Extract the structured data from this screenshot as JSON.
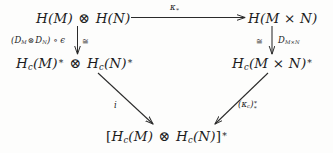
{
  "diagram": {
    "nodes": {
      "top_left": "H(M) ⊗ H(N)",
      "top_right": "H(M × N)",
      "middle_left": "H_c(M)* ⊗ H_c(N)*",
      "middle_right": "H_c(M × N)*",
      "bottom": "[H_c(M) ⊗ H_c(N)]*"
    },
    "arrows": {
      "top_horizontal": {
        "label": "κ∗",
        "from": "top_left",
        "to": "top_right"
      },
      "left_vertical": {
        "label": "(D_M ⊗ D_N) ∘ ϵ",
        "iso_label": "≅",
        "from": "top_left",
        "to": "middle_left"
      },
      "right_vertical": {
        "label": "D_{M×N}",
        "iso_label": "≅",
        "from": "top_right",
        "to": "middle_right"
      },
      "left_diagonal": {
        "label": "i",
        "from": "middle_left",
        "to": "bottom"
      },
      "right_diagonal": {
        "label": "(κ_c)*∗",
        "from": "middle_right",
        "to": "bottom"
      }
    },
    "colors": {
      "ink": "#1c1c1c",
      "stroke": "#2a2a2a",
      "background": "#fdfdfc"
    }
  }
}
